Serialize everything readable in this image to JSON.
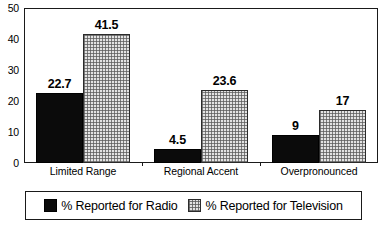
{
  "chart_data": {
    "type": "bar",
    "title": "",
    "subtitle": "",
    "xlabel": "",
    "ylabel": "",
    "categories": [
      "Limited Range",
      "Regional Accent",
      "Overpronounced"
    ],
    "series": [
      {
        "name": "% Reported for Radio",
        "values": [
          22.7,
          4.5,
          9
        ],
        "labels": [
          "22.7",
          "4.5",
          "9"
        ],
        "color": "#0b0b0b",
        "pattern": "solid-black"
      },
      {
        "name": "% Reported for Television",
        "values": [
          41.5,
          23.6,
          17
        ],
        "labels": [
          "41.5",
          "23.6",
          "17"
        ],
        "color": "#e3e3e3",
        "pattern": "fine-grid-hatch"
      }
    ],
    "ylim": [
      0,
      50
    ],
    "yticks": [
      0,
      10,
      20,
      30,
      40,
      50
    ],
    "ytick_labels": [
      "0",
      "10",
      "20",
      "30",
      "40",
      "50"
    ],
    "yticks_minor": [
      5,
      15,
      25,
      35,
      45
    ],
    "grid": false,
    "legend_position": "bottom",
    "frame": true
  },
  "legend": {
    "entries": [
      {
        "label": "% Reported for Radio",
        "swatch": "black-square-swatch"
      },
      {
        "label": "% Reported for Television",
        "swatch": "hatched-square-swatch"
      }
    ]
  }
}
